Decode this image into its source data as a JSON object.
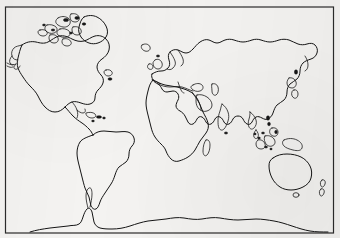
{
  "document": {
    "kind": "printed-map-scan",
    "title": "Blank World Map Outline",
    "caption": ""
  },
  "map": {
    "projection_label": "cylindrical",
    "frame": {
      "x": 5.5,
      "y": 7,
      "width": 328,
      "height": 226
    },
    "colors": {
      "paper": "#f4f3f1",
      "coastline": "#151515",
      "frame": "#2b2b2b"
    },
    "features": [
      {
        "name": "north-america",
        "label": "North America"
      },
      {
        "name": "greenland",
        "label": "Greenland"
      },
      {
        "name": "canadian-arctic-archipelago",
        "label": "Canadian Arctic Archipelago"
      },
      {
        "name": "alaska-aleutians",
        "label": "Alaska / Aleutian Islands"
      },
      {
        "name": "central-america",
        "label": "Central America"
      },
      {
        "name": "caribbean-islands",
        "label": "Caribbean Islands"
      },
      {
        "name": "south-america",
        "label": "South America"
      },
      {
        "name": "iceland",
        "label": "Iceland"
      },
      {
        "name": "british-isles",
        "label": "British Isles"
      },
      {
        "name": "scandinavia-europe",
        "label": "Europe"
      },
      {
        "name": "africa",
        "label": "Africa"
      },
      {
        "name": "madagascar",
        "label": "Madagascar"
      },
      {
        "name": "eurasia",
        "label": "Eurasia"
      },
      {
        "name": "arabian-peninsula",
        "label": "Arabian Peninsula"
      },
      {
        "name": "india-subcontinent",
        "label": "Indian Subcontinent"
      },
      {
        "name": "sri-lanka",
        "label": "Sri Lanka"
      },
      {
        "name": "japan",
        "label": "Japan"
      },
      {
        "name": "philippines",
        "label": "Philippines"
      },
      {
        "name": "indonesia",
        "label": "Indonesia"
      },
      {
        "name": "new-guinea",
        "label": "New Guinea"
      },
      {
        "name": "australia",
        "label": "Australia"
      },
      {
        "name": "tasmania",
        "label": "Tasmania"
      },
      {
        "name": "new-zealand",
        "label": "New Zealand"
      },
      {
        "name": "antarctica",
        "label": "Antarctica"
      }
    ]
  }
}
